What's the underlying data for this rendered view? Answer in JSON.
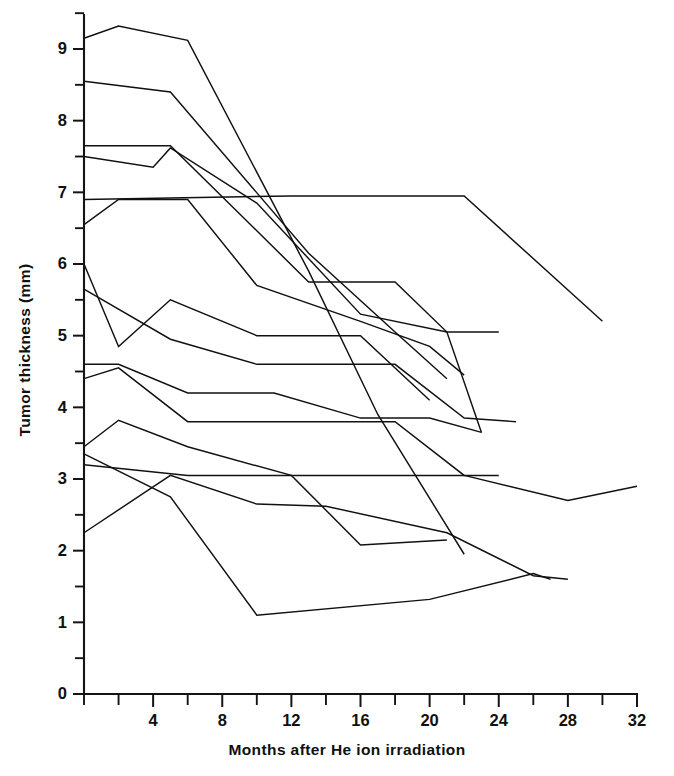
{
  "chart_data": {
    "type": "line",
    "title": "",
    "subtitle": "",
    "xlabel": "Months after He ion irradiation",
    "ylabel": "Tumor thickness (mm)",
    "xlim": [
      0,
      32
    ],
    "ylim": [
      0,
      9.6
    ],
    "x_major_ticks": [
      4,
      8,
      12,
      16,
      20,
      24,
      28,
      32
    ],
    "x_major_tick_labels": [
      "4",
      "8",
      "12",
      "16",
      "20",
      "24",
      "28",
      "32"
    ],
    "x_minor_tick_interval": 2,
    "y_major_ticks": [
      0,
      1,
      2,
      3,
      4,
      5,
      6,
      7,
      8,
      9
    ],
    "y_major_tick_labels": [
      "0",
      "1",
      "2",
      "3",
      "4",
      "5",
      "6",
      "7",
      "8",
      "9"
    ],
    "y_minor_tick_interval": 0.5,
    "grid": false,
    "legend": "none",
    "legend_position": "none",
    "annotations": [],
    "line_color": "#111111",
    "axis_color": "#141414",
    "background_color": "#ffffff",
    "series": [
      {
        "name": "patient-1",
        "x": [
          0,
          2,
          6,
          13,
          17,
          22
        ],
        "values": [
          9.15,
          9.32,
          9.12,
          5.9,
          3.9,
          1.95
        ]
      },
      {
        "name": "patient-2",
        "x": [
          0,
          5,
          13,
          18,
          21
        ],
        "values": [
          8.55,
          8.4,
          6.15,
          5.05,
          4.4
        ]
      },
      {
        "name": "patient-3",
        "x": [
          0,
          2,
          5,
          13,
          18,
          21,
          23
        ],
        "values": [
          7.65,
          7.65,
          7.65,
          5.75,
          5.75,
          5.05,
          3.65
        ]
      },
      {
        "name": "patient-4",
        "x": [
          0,
          4,
          5,
          10,
          16,
          21,
          24
        ],
        "values": [
          7.5,
          7.35,
          7.62,
          6.85,
          5.3,
          5.05,
          5.05
        ]
      },
      {
        "name": "patient-5",
        "x": [
          0,
          12,
          18,
          22,
          30
        ],
        "values": [
          6.9,
          6.95,
          6.95,
          6.95,
          5.2
        ]
      },
      {
        "name": "patient-6",
        "x": [
          0,
          2,
          6,
          10,
          16,
          20,
          22
        ],
        "values": [
          6.55,
          6.9,
          6.9,
          5.7,
          5.2,
          4.85,
          4.45
        ]
      },
      {
        "name": "patient-7",
        "x": [
          0,
          2,
          5,
          10,
          16,
          20
        ],
        "values": [
          6.0,
          4.85,
          5.5,
          5.0,
          5.0,
          4.1
        ]
      },
      {
        "name": "patient-8",
        "x": [
          0,
          5,
          10,
          18,
          22,
          25
        ],
        "values": [
          5.65,
          4.95,
          4.6,
          4.6,
          3.85,
          3.8
        ]
      },
      {
        "name": "patient-9",
        "x": [
          0,
          2,
          6,
          11,
          16,
          20,
          23
        ],
        "values": [
          4.6,
          4.6,
          4.2,
          4.2,
          3.85,
          3.85,
          3.65
        ]
      },
      {
        "name": "patient-10",
        "x": [
          0,
          2,
          6,
          18,
          22,
          24
        ],
        "values": [
          4.4,
          4.55,
          3.8,
          3.8,
          3.05,
          3.05
        ]
      },
      {
        "name": "patient-11",
        "x": [
          0,
          2,
          6,
          12,
          16,
          21
        ],
        "values": [
          3.45,
          3.82,
          3.45,
          3.05,
          2.08,
          2.15
        ]
      },
      {
        "name": "patient-12",
        "x": [
          0,
          6,
          15,
          22,
          28,
          32
        ],
        "values": [
          3.2,
          3.05,
          3.05,
          3.05,
          2.7,
          2.9
        ]
      },
      {
        "name": "patient-13",
        "x": [
          0,
          5,
          10,
          14,
          21,
          26,
          28
        ],
        "values": [
          2.25,
          3.05,
          2.65,
          2.62,
          2.25,
          1.65,
          1.6
        ]
      },
      {
        "name": "patient-14",
        "x": [
          0,
          5,
          10,
          20,
          26,
          27
        ],
        "values": [
          3.35,
          2.75,
          1.1,
          1.32,
          1.68,
          1.6
        ]
      }
    ]
  }
}
